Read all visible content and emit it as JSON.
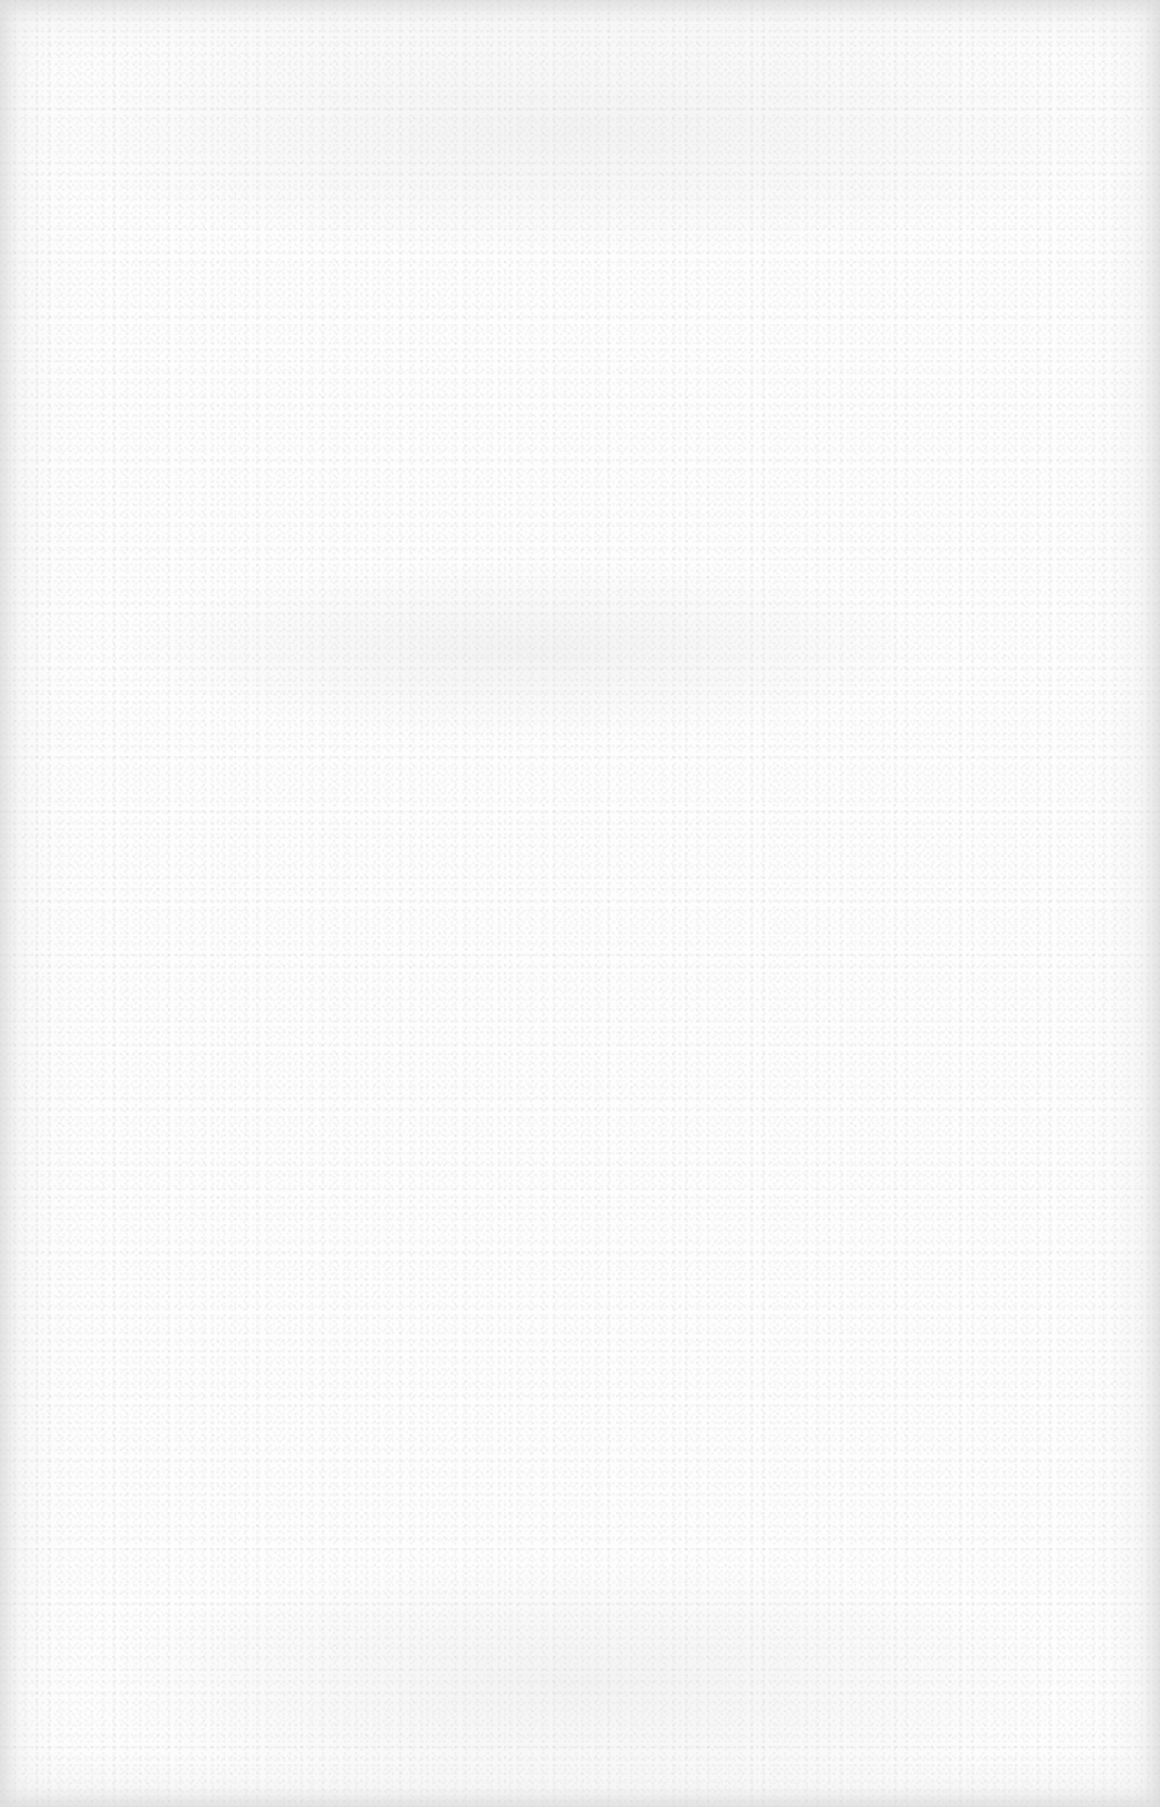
{
  "document": {
    "type": "blank-scanned-page",
    "text": "",
    "colors": {
      "paper": "#fdfdfd",
      "speckle": "#c8c8c8",
      "edge_shade": "#d6d6d6"
    }
  }
}
